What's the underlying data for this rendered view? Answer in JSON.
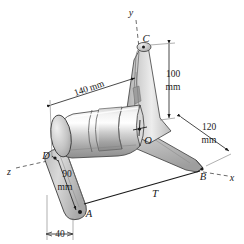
{
  "figure": {
    "type": "engineering-mechanics-3d-diagram",
    "background_color": "#ffffff",
    "line_color": "#1a1a1a",
    "body_light": "#f0f0f0",
    "body_mid": "#c8c8c8",
    "body_dark": "#9a9a9a"
  },
  "axes": [
    {
      "name": "y-axis",
      "label": "y",
      "x": 131,
      "y": 13
    },
    {
      "name": "x-axis",
      "label": "x",
      "x": 232,
      "y": 178
    },
    {
      "name": "z-axis",
      "label": "z",
      "x": 9,
      "y": 172
    }
  ],
  "points": [
    {
      "name": "point-C",
      "label": "C",
      "x": 145,
      "y": 41
    },
    {
      "name": "point-O",
      "label": "O",
      "x": 148,
      "y": 141
    },
    {
      "name": "point-B",
      "label": "B",
      "x": 203,
      "y": 175
    },
    {
      "name": "point-D",
      "label": "D",
      "x": 47,
      "y": 156
    },
    {
      "name": "point-A",
      "label": "A",
      "x": 88,
      "y": 215
    }
  ],
  "dimensions": [
    {
      "name": "dim-140mm",
      "value": "140 mm",
      "x": 88,
      "y": 90,
      "rotation": -20
    },
    {
      "name": "dim-100mm-line1",
      "value": "100",
      "x": 172,
      "y": 75
    },
    {
      "name": "dim-100mm-line2",
      "value": "mm",
      "x": 172,
      "y": 89
    },
    {
      "name": "dim-120mm-line1",
      "value": "120",
      "x": 208,
      "y": 128
    },
    {
      "name": "dim-120mm-line2",
      "value": "mm",
      "x": 208,
      "y": 141
    },
    {
      "name": "dim-90mm-line1",
      "value": "90",
      "x": 66,
      "y": 175
    },
    {
      "name": "dim-90mm-line2",
      "value": "mm",
      "x": 64,
      "y": 189
    },
    {
      "name": "dim-40",
      "value": "40",
      "x": 60,
      "y": 233
    }
  ],
  "loads": [
    {
      "name": "torque-T",
      "label": "T",
      "x": 155,
      "y": 195
    }
  ]
}
